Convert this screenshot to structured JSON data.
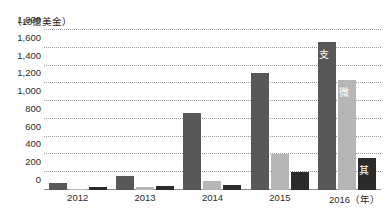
{
  "chart_data": {
    "type": "bar",
    "title": "",
    "subtitle": "",
    "unit_label": "（10億美金）",
    "xlabel": "（年）",
    "ylabel": "",
    "ylim": [
      0,
      1800
    ],
    "yticks": [
      0,
      200,
      400,
      600,
      800,
      1000,
      1200,
      1400,
      1600,
      1800
    ],
    "ytick_labels": [
      "0",
      "200",
      "400",
      "600",
      "800",
      "1,000",
      "1,200",
      "1,400",
      "1,600",
      "1,800"
    ],
    "grid": true,
    "grid_style": "dotted-horizontal",
    "legend_position": "in-bar-labels",
    "categories": [
      "2012",
      "2013",
      "2014",
      "2015",
      "2016"
    ],
    "series": [
      {
        "name": "支付寶",
        "color": "#585858",
        "values": [
          75,
          160,
          865,
          1320,
          1660
        ]
      },
      {
        "name": "微信支付",
        "color": "#b6b6b6",
        "values": [
          5,
          30,
          100,
          410,
          1235
        ]
      },
      {
        "name": "其他",
        "color": "#2b2b2b",
        "values": [
          35,
          40,
          55,
          200,
          355
        ]
      }
    ],
    "annotations": [
      {
        "text": "支付寶",
        "series": "支付寶",
        "category": "2016"
      },
      {
        "text": "微信支付",
        "series": "微信支付",
        "category": "2016"
      },
      {
        "text": "其他",
        "series": "其他",
        "category": "2016"
      }
    ]
  },
  "colors": {
    "background": "#ffffff",
    "axis": "#8e8e8e",
    "gridline": "#9a9a9a",
    "text": "#2b2b2b",
    "bar_dark": "#585858",
    "bar_light": "#b6b6b6",
    "bar_black": "#2b2b2b",
    "bar_label_text": "#ffffff"
  }
}
